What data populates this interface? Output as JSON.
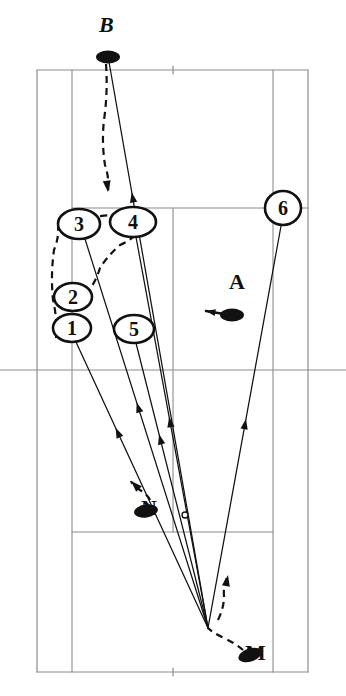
{
  "figure": {
    "kind": "tennis-court-tactical-diagram",
    "width": 346,
    "height": 696,
    "background": "#ffffff",
    "line_color": "#8c8c8c",
    "ink_color": "#111111"
  },
  "court": {
    "name": "tennis-court",
    "outer": {
      "left": 37,
      "right": 308,
      "top": 70,
      "bottom": 672
    },
    "singles_sidelines": {
      "left_x": 72,
      "right_x": 273
    },
    "service_lines": {
      "top_y": 208,
      "bottom_y": 532
    },
    "center_service_line_x": 173,
    "center_line_y": 370,
    "center_marks": [
      {
        "x": 173,
        "y": 70,
        "len": 8
      },
      {
        "x": 173,
        "y": 672,
        "len": 8
      }
    ]
  },
  "players": [
    {
      "id": "B",
      "label": "B",
      "x": 108,
      "y": 57,
      "label_x": 99,
      "label_y": 32,
      "facing": "none"
    },
    {
      "id": "A",
      "label": "A",
      "x": 232,
      "y": 315,
      "label_x": 229,
      "label_y": 289,
      "facing": "left"
    },
    {
      "id": "N",
      "label": "N",
      "x": 146,
      "y": 511,
      "label_x": 141,
      "label_y": 515,
      "facing": "upleft"
    },
    {
      "id": "M",
      "label": "M",
      "x": 250,
      "y": 655,
      "label_x": 245,
      "label_y": 660,
      "facing": "none"
    }
  ],
  "numbered_markers": [
    {
      "n": "1",
      "cx": 72,
      "cy": 328,
      "rx": 19,
      "ry": 14
    },
    {
      "n": "2",
      "cx": 73,
      "cy": 297,
      "rx": 19,
      "ry": 14
    },
    {
      "n": "3",
      "cx": 79,
      "cy": 224,
      "rx": 21,
      "ry": 15
    },
    {
      "n": "4",
      "cx": 133,
      "cy": 222,
      "rx": 23,
      "ry": 15
    },
    {
      "n": "5",
      "cx": 134,
      "cy": 329,
      "rx": 20,
      "ry": 14
    },
    {
      "n": "6",
      "cx": 283,
      "cy": 208,
      "rx": 18,
      "ry": 17
    }
  ],
  "ball_mark": {
    "name": "ball-contact-point",
    "x": 185,
    "y": 515,
    "r": 3
  },
  "convergence_point": {
    "x": 208,
    "y": 628
  },
  "solid_shot_paths": [
    {
      "name": "shot-path-B-to-court",
      "from": [
        109,
        62
      ],
      "to": [
        208,
        628
      ],
      "arrow_at": 0.23
    },
    {
      "name": "shot-path-1-to-hitter",
      "from": [
        76,
        342
      ],
      "to": [
        208,
        628
      ],
      "arrow_at": 0.3
    },
    {
      "name": "shot-path-3-to-hitter",
      "from": [
        85,
        239
      ],
      "to": [
        208,
        628
      ],
      "arrow_at": 0.42
    },
    {
      "name": "shot-path-5-to-hitter",
      "from": [
        136,
        343
      ],
      "to": [
        208,
        628
      ],
      "arrow_at": 0.32
    },
    {
      "name": "shot-path-4-to-hitter",
      "from": [
        136,
        237
      ],
      "to": [
        208,
        628
      ],
      "arrow_at": 0.46
    },
    {
      "name": "shot-path-6-to-hitter",
      "from": [
        281,
        226
      ],
      "to": [
        208,
        628
      ],
      "arrow_at": 0.48
    }
  ],
  "dashed_movement_paths": [
    {
      "name": "movement-B-forward",
      "points": [
        [
          106,
          64
        ],
        [
          104,
          120
        ],
        [
          105,
          165
        ],
        [
          108,
          192
        ]
      ],
      "arrow_end": true
    },
    {
      "name": "movement-3-to-4",
      "points": [
        [
          88,
          217
        ],
        [
          110,
          215
        ],
        [
          130,
          214
        ]
      ],
      "arrow_end": false
    },
    {
      "name": "movement-1-2-3-box",
      "points": [
        [
          56,
          338
        ],
        [
          53,
          300
        ],
        [
          54,
          250
        ],
        [
          58,
          226
        ]
      ],
      "arrow_end": false
    },
    {
      "name": "movement-2-arc-4",
      "points": [
        [
          86,
          295
        ],
        [
          100,
          268
        ],
        [
          120,
          245
        ],
        [
          134,
          236
        ]
      ],
      "arrow_end": false
    },
    {
      "name": "movement-N-up",
      "points": [
        [
          150,
          500
        ],
        [
          140,
          490
        ],
        [
          131,
          481
        ]
      ],
      "arrow_end": true
    },
    {
      "name": "movement-M-to-court",
      "points": [
        [
          243,
          650
        ],
        [
          224,
          638
        ],
        [
          208,
          628
        ]
      ],
      "arrow_end": false
    },
    {
      "name": "movement-hitter-up",
      "points": [
        [
          218,
          620
        ],
        [
          224,
          596
        ],
        [
          228,
          575
        ]
      ],
      "arrow_end": true
    }
  ],
  "arrow_markers": [
    {
      "name": "arrow-B-path",
      "x": 128,
      "y": 200,
      "angle": 100
    },
    {
      "name": "arrow-shot-1",
      "x": 100,
      "y": 395,
      "angle": -64
    },
    {
      "name": "arrow-shot-3",
      "x": 122,
      "y": 390,
      "angle": -73
    },
    {
      "name": "arrow-shot-5",
      "x": 160,
      "y": 410,
      "angle": -74
    },
    {
      "name": "arrow-shot-4",
      "x": 170,
      "y": 360,
      "angle": -79
    },
    {
      "name": "arrow-shot-6",
      "x": 248,
      "y": 385,
      "angle": -104
    }
  ]
}
